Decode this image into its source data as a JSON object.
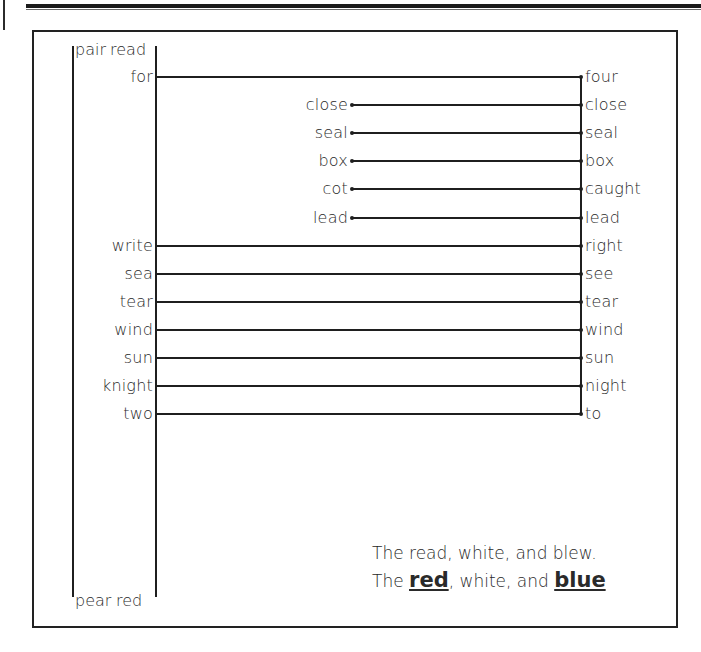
{
  "figure": {
    "left_set_label_top": "pair",
    "left_set_label_bottom": "pear",
    "mid_set_label_top": "read",
    "mid_set_label_bottom": "red",
    "rows": [
      {
        "left": "for",
        "mid": "",
        "right": "four",
        "origin": "mid"
      },
      {
        "left": "",
        "mid": "close",
        "right": "close",
        "origin": "free"
      },
      {
        "left": "",
        "mid": "seal",
        "right": "seal",
        "origin": "free"
      },
      {
        "left": "",
        "mid": "box",
        "right": "box",
        "origin": "free"
      },
      {
        "left": "",
        "mid": "cot",
        "right": "caught",
        "origin": "free"
      },
      {
        "left": "",
        "mid": "lead",
        "right": "lead",
        "origin": "free"
      },
      {
        "left": "write",
        "mid": "",
        "right": "right",
        "origin": "mid"
      },
      {
        "left": "sea",
        "mid": "",
        "right": "see",
        "origin": "mid"
      },
      {
        "left": "tear",
        "mid": "",
        "right": "tear",
        "origin": "mid"
      },
      {
        "left": "wind",
        "mid": "",
        "right": "wind",
        "origin": "mid"
      },
      {
        "left": "sun",
        "mid": "",
        "right": "sun",
        "origin": "mid"
      },
      {
        "left": "knight",
        "mid": "",
        "right": "night",
        "origin": "mid"
      },
      {
        "left": "two",
        "mid": "",
        "right": "to",
        "origin": "mid"
      }
    ]
  },
  "caption": {
    "line1": "The read, white, and blew.",
    "line2_part1": "The ",
    "line2_emph1": "red",
    "line2_part2": ", white, and ",
    "line2_emph2": "blue"
  },
  "colors": {
    "ink": "#1f1f1f",
    "text": "#2a2a2a",
    "paper": "#ffffff"
  }
}
